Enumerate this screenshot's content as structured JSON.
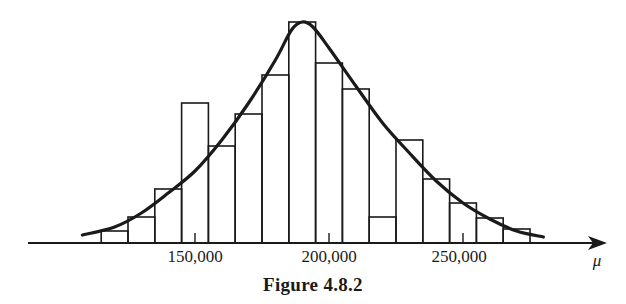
{
  "caption": "Figure 4.8.2",
  "axis": {
    "variable_label": "μ",
    "tick_labels": [
      "150,000",
      "200,000",
      "250,000"
    ]
  },
  "chart_data": {
    "type": "bar",
    "subtype": "histogram with fitted density curve",
    "title": "Figure 4.8.2",
    "xlabel": "μ",
    "ylabel": "",
    "x_ticks": [
      150000,
      200000,
      250000
    ],
    "x_tick_labels": [
      "150,000",
      "200,000",
      "250,000"
    ],
    "bin_edges": [
      115000,
      125000,
      135000,
      145000,
      155000,
      165000,
      175000,
      185000,
      195000,
      205000,
      215000,
      225000,
      235000,
      245000,
      255000,
      265000,
      275000
    ],
    "categories": [
      "115-125k",
      "125-135k",
      "135-145k",
      "145-155k",
      "155-165k",
      "165-175k",
      "175-185k",
      "185-195k",
      "195-205k",
      "205-215k",
      "215-225k",
      "225-235k",
      "235-245k",
      "245-255k",
      "255-265k",
      "265-275k"
    ],
    "values": [
      12,
      26,
      54,
      140,
      97,
      129,
      168,
      221,
      180,
      154,
      26,
      103,
      64,
      40,
      25,
      14
    ],
    "value_units": "relative frequency (arbitrary, pixel-scale)",
    "curve": {
      "name": "fitted density",
      "points": [
        [
          108000,
          8
        ],
        [
          120000,
          16
        ],
        [
          130000,
          30
        ],
        [
          140000,
          50
        ],
        [
          150000,
          72
        ],
        [
          160000,
          103
        ],
        [
          170000,
          140
        ],
        [
          180000,
          183
        ],
        [
          186000,
          213
        ],
        [
          190000,
          221
        ],
        [
          194000,
          216
        ],
        [
          200000,
          195
        ],
        [
          210000,
          157
        ],
        [
          220000,
          120
        ],
        [
          230000,
          90
        ],
        [
          240000,
          62
        ],
        [
          250000,
          40
        ],
        [
          260000,
          24
        ],
        [
          270000,
          12
        ],
        [
          280000,
          6
        ]
      ]
    },
    "grid": false,
    "legend": null,
    "y_axis_shown": false
  }
}
